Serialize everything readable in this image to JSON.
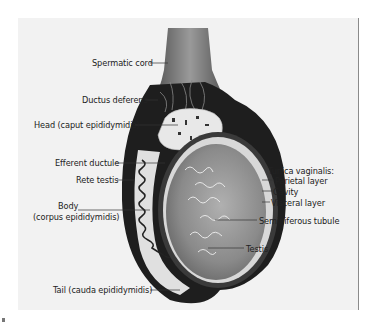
{
  "figure": {
    "colors": {
      "background": "#ffffff",
      "panel": "#f2f2f2",
      "cord": "#6f6f6f",
      "dark_tissue": "#1e1e1e",
      "testis": "#8c8c8c",
      "tubule_lines": "#f0f0f0",
      "label_text": "#222222"
    }
  },
  "labels": {
    "spermatic_cord": "Spermatic cord",
    "ductus_deferens": "Ductus deferens",
    "head": "Head (caput epididymidis)",
    "efferent_ductule": "Efferent ductule",
    "rete_testis": "Rete testis",
    "body_line1": "Body",
    "body_line2": "(corpus epididymidis)",
    "tail": "Tail (cauda epididymidis)",
    "tunica_vaginalis": "Tunica vaginalis:",
    "parietal_layer": "Parietal layer",
    "cavity": "Cavity",
    "visceral_layer": "Visceral layer",
    "seminiferous_tubule": "Seminiferous tubule",
    "testis": "Testis"
  }
}
